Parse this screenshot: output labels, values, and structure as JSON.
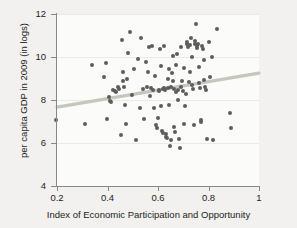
{
  "chart_data": {
    "type": "scatter",
    "title": "",
    "xlabel": "Index of Economic Participation and Opportunity",
    "ylabel": "per capita GDP in 2009 (in logs)",
    "xlim": [
      0.2,
      1.0
    ],
    "ylim": [
      4,
      12
    ],
    "xticks": [
      "0.2",
      "0.4",
      "0.6",
      "0.8",
      "1"
    ],
    "xtick_values": [
      0.2,
      0.4,
      0.6,
      0.8,
      1
    ],
    "yticks": [
      "4",
      "6",
      "8",
      "10",
      "12"
    ],
    "ytick_values": [
      4,
      6,
      8,
      10,
      12
    ],
    "grid": "horizontal",
    "legend": null,
    "point_color": "#5d5d5d",
    "fit_line_color": "#c3c8bd",
    "plot_background": "#fbfbfa",
    "figure_background": "#f2f1ef",
    "fit_line": {
      "name": "linear fit",
      "x_start": 0.2,
      "y_start": 7.67,
      "x_end": 1.0,
      "y_end": 9.25
    },
    "series": [
      {
        "name": "countries",
        "points": [
          [
            0.195,
            7.05
          ],
          [
            0.312,
            6.9
          ],
          [
            0.338,
            9.63
          ],
          [
            0.385,
            9.05
          ],
          [
            0.395,
            9.73
          ],
          [
            0.398,
            7.12
          ],
          [
            0.404,
            8.15
          ],
          [
            0.409,
            7.97
          ],
          [
            0.412,
            7.92
          ],
          [
            0.42,
            8.45
          ],
          [
            0.428,
            8.4
          ],
          [
            0.432,
            8.35
          ],
          [
            0.44,
            8.6
          ],
          [
            0.447,
            8.52
          ],
          [
            0.452,
            6.37
          ],
          [
            0.456,
            10.78
          ],
          [
            0.46,
            8.88
          ],
          [
            0.463,
            9.28
          ],
          [
            0.466,
            8.62
          ],
          [
            0.47,
            7.78
          ],
          [
            0.475,
            6.88
          ],
          [
            0.479,
            8.97
          ],
          [
            0.483,
            10.19
          ],
          [
            0.49,
            11.17
          ],
          [
            0.497,
            8.25
          ],
          [
            0.505,
            9.45
          ],
          [
            0.512,
            6.12
          ],
          [
            0.52,
            9.9
          ],
          [
            0.528,
            7.62
          ],
          [
            0.534,
            10.88
          ],
          [
            0.54,
            8.5
          ],
          [
            0.545,
            7.1
          ],
          [
            0.552,
            9.78
          ],
          [
            0.558,
            8.62
          ],
          [
            0.562,
            9.3
          ],
          [
            0.566,
            10.45
          ],
          [
            0.57,
            8.2
          ],
          [
            0.574,
            8.55
          ],
          [
            0.578,
            10.5
          ],
          [
            0.582,
            8.48
          ],
          [
            0.586,
            7.65
          ],
          [
            0.59,
            9.12
          ],
          [
            0.593,
            6.82
          ],
          [
            0.596,
            6.72
          ],
          [
            0.599,
            7.15
          ],
          [
            0.602,
            8.48
          ],
          [
            0.604,
            8.42
          ],
          [
            0.607,
            10.35
          ],
          [
            0.61,
            9.6
          ],
          [
            0.613,
            7.72
          ],
          [
            0.616,
            6.58
          ],
          [
            0.618,
            6.48
          ],
          [
            0.62,
            8.5
          ],
          [
            0.622,
            8.55
          ],
          [
            0.625,
            10.5
          ],
          [
            0.628,
            8.45
          ],
          [
            0.63,
            6.42
          ],
          [
            0.632,
            6.28
          ],
          [
            0.635,
            6.25
          ],
          [
            0.638,
            9.0
          ],
          [
            0.64,
            8.58
          ],
          [
            0.642,
            7.78
          ],
          [
            0.645,
            9.42
          ],
          [
            0.648,
            5.88
          ],
          [
            0.65,
            6.15
          ],
          [
            0.652,
            8.62
          ],
          [
            0.655,
            9.25
          ],
          [
            0.658,
            10.05
          ],
          [
            0.66,
            8.9
          ],
          [
            0.662,
            8.5
          ],
          [
            0.665,
            6.75
          ],
          [
            0.668,
            6.52
          ],
          [
            0.67,
            8.35
          ],
          [
            0.673,
            9.65
          ],
          [
            0.676,
            10.12
          ],
          [
            0.678,
            8.48
          ],
          [
            0.681,
            7.98
          ],
          [
            0.684,
            6.2
          ],
          [
            0.687,
            5.78
          ],
          [
            0.69,
            8.62
          ],
          [
            0.693,
            10.45
          ],
          [
            0.695,
            8.9
          ],
          [
            0.698,
            8.42
          ],
          [
            0.701,
            6.88
          ],
          [
            0.704,
            9.5
          ],
          [
            0.707,
            7.72
          ],
          [
            0.71,
            8.28
          ],
          [
            0.713,
            10.6
          ],
          [
            0.716,
            10.72
          ],
          [
            0.719,
            10.48
          ],
          [
            0.722,
            8.82
          ],
          [
            0.725,
            9.32
          ],
          [
            0.728,
            10.55
          ],
          [
            0.73,
            10.88
          ],
          [
            0.733,
            9.98
          ],
          [
            0.736,
            8.68
          ],
          [
            0.739,
            8.5
          ],
          [
            0.742,
            6.85
          ],
          [
            0.745,
            10.62
          ],
          [
            0.748,
            10.75
          ],
          [
            0.751,
            11.55
          ],
          [
            0.753,
            10.5
          ],
          [
            0.756,
            10.42
          ],
          [
            0.758,
            10.6
          ],
          [
            0.761,
            9.55
          ],
          [
            0.764,
            8.78
          ],
          [
            0.767,
            8.55
          ],
          [
            0.77,
            6.98
          ],
          [
            0.772,
            7.05
          ],
          [
            0.775,
            10.52
          ],
          [
            0.778,
            10.38
          ],
          [
            0.781,
            9.88
          ],
          [
            0.784,
            8.92
          ],
          [
            0.787,
            8.6
          ],
          [
            0.79,
            8.45
          ],
          [
            0.793,
            6.18
          ],
          [
            0.8,
            10.68
          ],
          [
            0.806,
            9.08
          ],
          [
            0.812,
            10.02
          ],
          [
            0.818,
            6.15
          ],
          [
            0.835,
            11.28
          ],
          [
            0.885,
            7.4
          ],
          [
            0.888,
            6.7
          ]
        ]
      }
    ]
  }
}
